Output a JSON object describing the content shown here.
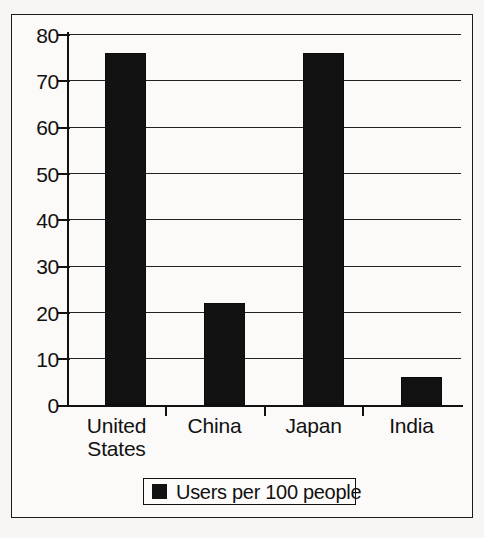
{
  "chart_data": {
    "type": "bar",
    "title": "",
    "subtitle": "",
    "xlabel": "",
    "ylabel": "",
    "categories": [
      "United States",
      "China",
      "Japan",
      "India"
    ],
    "category_lines": [
      [
        "United",
        "States"
      ],
      [
        "China"
      ],
      [
        "Japan"
      ],
      [
        "India"
      ]
    ],
    "values": [
      76,
      22,
      76,
      6
    ],
    "series": [
      {
        "name": "Users per 100 people",
        "values": [
          76,
          22,
          76,
          6
        ],
        "color": "#121212"
      }
    ],
    "ylim": [
      0,
      80
    ],
    "ytick_step": 10,
    "yticks": [
      "0",
      "10",
      "20",
      "30",
      "40",
      "50",
      "60",
      "70",
      "80"
    ],
    "grid": "horizontal",
    "legend_position": "bottom",
    "legend": [
      {
        "label": "Users per 100 people",
        "color": "#121212",
        "marker": "square"
      }
    ],
    "annotations": []
  },
  "figure": {
    "border_color": "#1b1b1b",
    "background_color": "#fbfaf8",
    "page_background": "#f7f6f4",
    "axis_color": "#111111"
  }
}
